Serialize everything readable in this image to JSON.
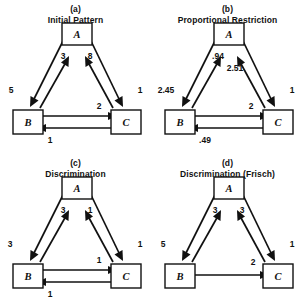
{
  "figure": {
    "node_labels": {
      "a": "A",
      "b": "B",
      "c": "C"
    },
    "ink_color": "#111111",
    "background_color": "#ffffff"
  },
  "panels": [
    {
      "tag": "(a)",
      "title": "Initial Pattern",
      "nodes": [
        {
          "id": "A",
          "label": "A"
        },
        {
          "id": "B",
          "label": "B"
        },
        {
          "id": "C",
          "label": "C"
        }
      ],
      "edges": [
        {
          "from": "A",
          "to": "B",
          "value": "5",
          "side": "left-outer"
        },
        {
          "from": "B",
          "to": "A",
          "value": "3",
          "side": "left-inner"
        },
        {
          "from": "C",
          "to": "A",
          "value": "8",
          "side": "right-inner"
        },
        {
          "from": "A",
          "to": "C",
          "value": "1",
          "side": "right-outer"
        },
        {
          "from": "B",
          "to": "C",
          "value": "2",
          "side": "bottom-upper"
        },
        {
          "from": "C",
          "to": "B",
          "value": "1",
          "side": "bottom-lower"
        }
      ]
    },
    {
      "tag": "(b)",
      "title": "Proportional Restriction",
      "nodes": [
        {
          "id": "A",
          "label": "A"
        },
        {
          "id": "B",
          "label": "B"
        },
        {
          "id": "C",
          "label": "C"
        }
      ],
      "edges": [
        {
          "from": "A",
          "to": "B",
          "value": "2.45",
          "side": "left-outer"
        },
        {
          "from": "B",
          "to": "A",
          "value": ".94",
          "side": "left-inner"
        },
        {
          "from": "C",
          "to": "A",
          "value": "2.51",
          "side": "right-inner"
        },
        {
          "from": "A",
          "to": "C",
          "value": "1",
          "side": "right-outer"
        },
        {
          "from": "B",
          "to": "C",
          "value": "2",
          "side": "bottom-upper"
        },
        {
          "from": "C",
          "to": "B",
          "value": ".49",
          "side": "bottom-lower"
        }
      ]
    },
    {
      "tag": "(c)",
      "title": "Discrimination",
      "nodes": [
        {
          "id": "A",
          "label": "A"
        },
        {
          "id": "B",
          "label": "B"
        },
        {
          "id": "C",
          "label": "C"
        }
      ],
      "edges": [
        {
          "from": "A",
          "to": "B",
          "value": "3",
          "side": "left-outer"
        },
        {
          "from": "B",
          "to": "A",
          "value": "3",
          "side": "left-inner"
        },
        {
          "from": "C",
          "to": "A",
          "value": "1",
          "side": "right-inner"
        },
        {
          "from": "A",
          "to": "C",
          "value": "1",
          "side": "right-outer"
        },
        {
          "from": "B",
          "to": "C",
          "value": "1",
          "side": "bottom-upper"
        },
        {
          "from": "C",
          "to": "B",
          "value": "1",
          "side": "bottom-lower"
        }
      ]
    },
    {
      "tag": "(d)",
      "title": "Discrimination (Frisch)",
      "nodes": [
        {
          "id": "A",
          "label": "A"
        },
        {
          "id": "B",
          "label": "B"
        },
        {
          "id": "C",
          "label": "C"
        }
      ],
      "edges": [
        {
          "from": "A",
          "to": "B",
          "value": "5",
          "side": "left-outer"
        },
        {
          "from": "B",
          "to": "A",
          "value": "3",
          "side": "left-inner"
        },
        {
          "from": "C",
          "to": "A",
          "value": "3",
          "side": "right-inner"
        },
        {
          "from": "A",
          "to": "C",
          "value": "1",
          "side": "right-outer"
        },
        {
          "from": "B",
          "to": "C",
          "value": "2",
          "side": "bottom-upper"
        }
      ]
    }
  ],
  "labels": {
    "a": {
      "caption_tag": "(a)",
      "caption_title": "Initial Pattern",
      "node_a": "A",
      "node_b": "B",
      "node_c": "C",
      "left_outer": "5",
      "left_inner": "3",
      "right_inner": "8",
      "right_outer": "1",
      "bottom_upper": "2",
      "bottom_lower": "1"
    },
    "b": {
      "caption_tag": "(b)",
      "caption_title": "Proportional Restriction",
      "node_a": "A",
      "node_b": "B",
      "node_c": "C",
      "left_outer": "2.45",
      "left_inner": ".94",
      "right_inner": "2.51",
      "right_outer": "1",
      "bottom_upper": "2",
      "bottom_lower": ".49"
    },
    "c": {
      "caption_tag": "(c)",
      "caption_title": "Discrimination",
      "node_a": "A",
      "node_b": "B",
      "node_c": "C",
      "left_outer": "3",
      "left_inner": "3",
      "right_inner": "1",
      "right_outer": "1",
      "bottom_upper": "1",
      "bottom_lower": "1"
    },
    "d": {
      "caption_tag": "(d)",
      "caption_title": "Discrimination (Frisch)",
      "node_a": "A",
      "node_b": "B",
      "node_c": "C",
      "left_outer": "5",
      "left_inner": "3",
      "right_inner": "3",
      "right_outer": "1",
      "bottom_upper": "2"
    }
  }
}
